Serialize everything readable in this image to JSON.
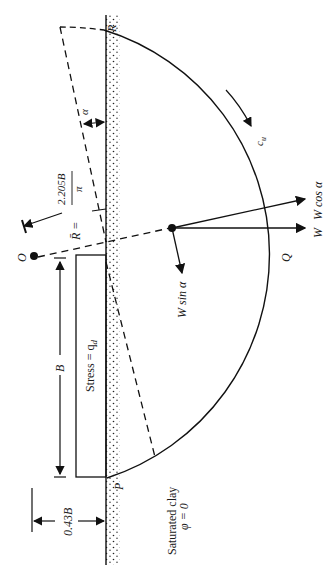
{
  "figure": {
    "orientation": "rotated 90 degrees counter-clockwise",
    "labels": {
      "R_point": "R",
      "P_point": "P",
      "Q_point": "Q",
      "O_point": "O",
      "alpha": "α",
      "cu": "c",
      "cu_sub": "u",
      "W_cos": "W cos α",
      "W": "W",
      "W_sin": "W sin α",
      "R_bar": "R̄ =",
      "R_num": "2.205B",
      "R_den": "π",
      "B": "B",
      "stress": "Stress = q",
      "stress_sub": "d",
      "offset": "0.43B",
      "soil_line1": "Saturated clay",
      "soil_line2": "φ = 0"
    }
  }
}
